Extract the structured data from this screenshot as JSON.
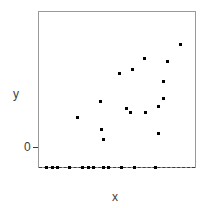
{
  "chart_data": {
    "type": "scatter",
    "title": "",
    "xlabel": "x",
    "ylabel": "y",
    "y_tick_labels": [
      "0"
    ],
    "y_tick_values": [
      0
    ],
    "x_tick_labels": [],
    "grid": false,
    "legend": null,
    "xlim": [
      0,
      1
    ],
    "ylim": [
      0,
      1.15
    ],
    "reference_line": {
      "orientation": "horizontal",
      "value": 0,
      "style": "dashed",
      "label": "0"
    },
    "series": [
      {
        "name": "zero-valued observations",
        "marker": "square",
        "color": "#000000",
        "x": [
          0.051,
          0.089,
          0.12,
          0.196,
          0.278,
          0.316,
          0.348,
          0.411,
          0.443,
          0.532,
          0.614,
          0.747
        ],
        "y": [
          0,
          0,
          0,
          0,
          0,
          0,
          0,
          0,
          0,
          0,
          0,
          0
        ]
      },
      {
        "name": "positive observations",
        "marker": "square",
        "color": "#000000",
        "x": [
          0.247,
          0.399,
          0.411,
          0.392,
          0.519,
          0.563,
          0.589,
          0.684,
          0.766,
          0.601,
          0.677,
          0.797,
          0.797,
          0.823,
          0.906,
          0.766
        ],
        "y": [
          0.365,
          0.277,
          0.207,
          0.489,
          0.694,
          0.436,
          0.405,
          0.405,
          0.449,
          0.725,
          0.803,
          0.51,
          0.637,
          0.781,
          0.911,
          0.249
        ]
      }
    ]
  },
  "labels": {
    "y": "y",
    "x": "x",
    "zero": "0"
  }
}
